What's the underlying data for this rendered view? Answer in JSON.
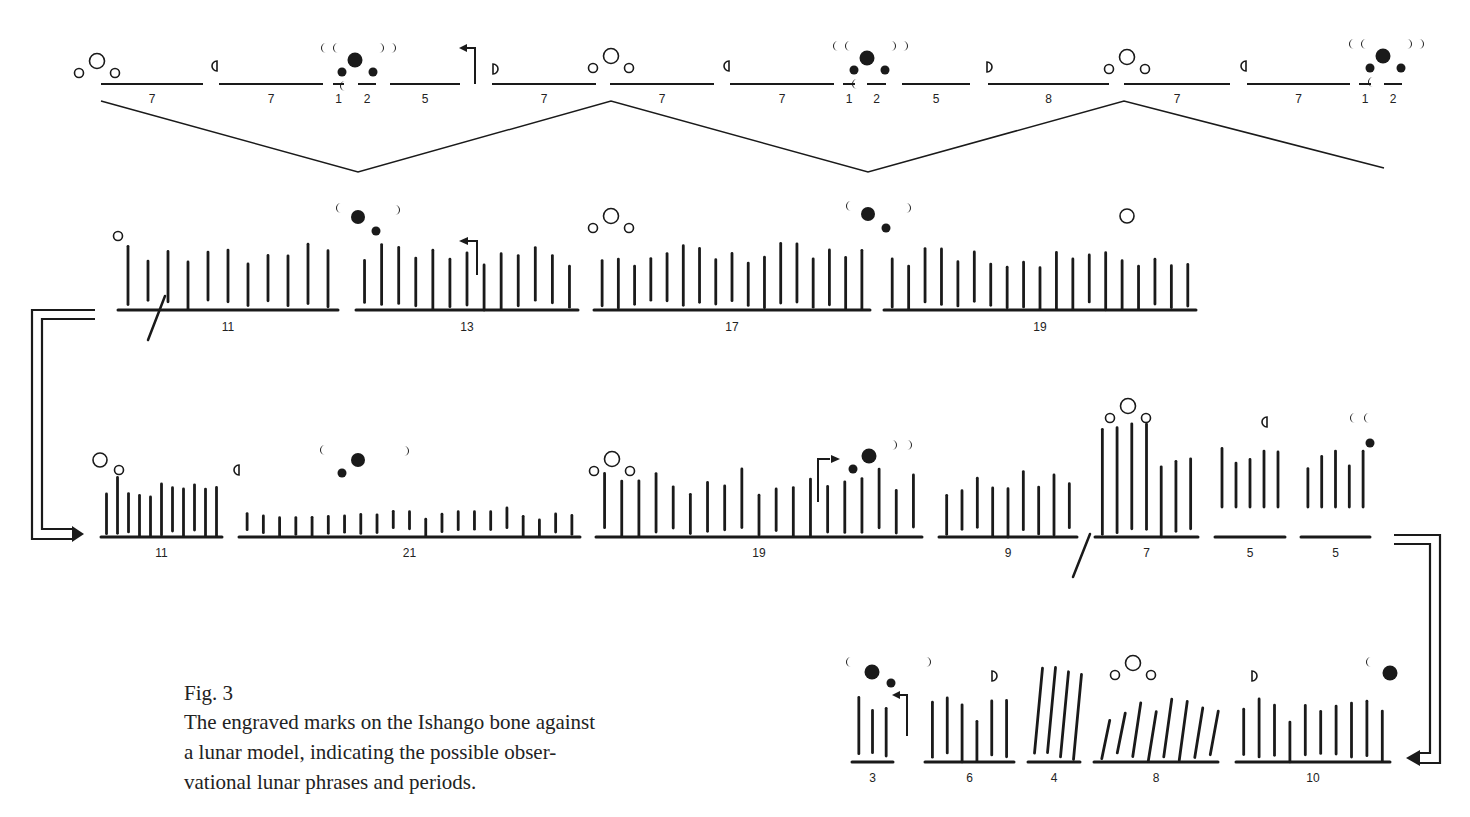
{
  "caption": {
    "label": "Fig. 3",
    "text_lines": [
      "The engraved marks on the Ishango bone against",
      "a lunar model, indicating the possible obser-",
      "vational lunar phrases and periods."
    ]
  },
  "colors": {
    "ink": "#1a1a1a",
    "background": "#ffffff"
  },
  "lunar_model": {
    "baseline_y": 84,
    "label_y": 103,
    "segments": [
      {
        "x1": 101,
        "x2": 203,
        "label": "7"
      },
      {
        "x1": 219,
        "x2": 323,
        "label": "7"
      },
      {
        "x1": 333,
        "x2": 344,
        "label": "1"
      },
      {
        "x1": 358,
        "x2": 376,
        "label": "2"
      },
      {
        "x1": 390,
        "x2": 460,
        "label": "5"
      },
      {
        "x1": 492,
        "x2": 596,
        "label": "7"
      },
      {
        "x1": 610,
        "x2": 714,
        "label": "7"
      },
      {
        "x1": 730,
        "x2": 834,
        "label": "7"
      },
      {
        "x1": 843,
        "x2": 855,
        "label": "1"
      },
      {
        "x1": 867,
        "x2": 886,
        "label": "2"
      },
      {
        "x1": 902,
        "x2": 970,
        "label": "5"
      },
      {
        "x1": 988,
        "x2": 1109,
        "label": "8"
      },
      {
        "x1": 1124,
        "x2": 1230,
        "label": "7"
      },
      {
        "x1": 1247,
        "x2": 1350,
        "label": "7"
      },
      {
        "x1": 1359,
        "x2": 1371,
        "label": "1"
      },
      {
        "x1": 1384,
        "x2": 1402,
        "label": "2"
      }
    ],
    "zigzag": [
      [
        101,
        101
      ],
      [
        358,
        172
      ],
      [
        611,
        101
      ],
      [
        868,
        172
      ],
      [
        1124,
        101
      ],
      [
        1384,
        168
      ]
    ],
    "full_moons": [
      {
        "x": 97,
        "y": 61
      },
      {
        "x": 611,
        "y": 56
      },
      {
        "x": 1127,
        "y": 57
      }
    ],
    "quarter_moons": [
      {
        "x": 215,
        "y": 66,
        "type": "first"
      },
      {
        "x": 495,
        "y": 69,
        "type": "last"
      },
      {
        "x": 727,
        "y": 66,
        "type": "first"
      },
      {
        "x": 989,
        "y": 67,
        "type": "last"
      },
      {
        "x": 1244,
        "y": 66,
        "type": "first"
      }
    ],
    "new_moons": [
      {
        "x": 355,
        "y": 60
      },
      {
        "x": 867,
        "y": 58
      },
      {
        "x": 1383,
        "y": 56
      }
    ],
    "direction_arrow": {
      "x": 475,
      "y_top": 48,
      "y_bottom": 84
    }
  },
  "bone_rows": [
    {
      "name": "row-1",
      "baseline_y": 310,
      "label_y": 331,
      "groups": [
        {
          "x1": 118,
          "x2": 338,
          "label": "11"
        },
        {
          "x1": 356,
          "x2": 578,
          "label": "13"
        },
        {
          "x1": 594,
          "x2": 870,
          "label": "17"
        },
        {
          "x1": 884,
          "x2": 1196,
          "label": "19"
        }
      ]
    },
    {
      "name": "row-2",
      "baseline_y": 537,
      "label_y": 557,
      "groups": [
        {
          "x1": 101,
          "x2": 222,
          "label": "11"
        },
        {
          "x1": 239,
          "x2": 580,
          "label": "21"
        },
        {
          "x1": 596,
          "x2": 922,
          "label": "19"
        },
        {
          "x1": 939,
          "x2": 1077,
          "label": "9"
        },
        {
          "x1": 1095,
          "x2": 1198,
          "label": "7"
        },
        {
          "x1": 1215,
          "x2": 1285,
          "label": "5"
        },
        {
          "x1": 1301,
          "x2": 1370,
          "label": "5"
        }
      ]
    },
    {
      "name": "row-3",
      "baseline_y": 762,
      "label_y": 782,
      "groups": [
        {
          "x1": 852,
          "x2": 893,
          "label": "3"
        },
        {
          "x1": 925,
          "x2": 1014,
          "label": "6"
        },
        {
          "x1": 1028,
          "x2": 1080,
          "label": "4"
        },
        {
          "x1": 1094,
          "x2": 1218,
          "label": "8"
        },
        {
          "x1": 1236,
          "x2": 1390,
          "label": "10"
        }
      ]
    }
  ]
}
